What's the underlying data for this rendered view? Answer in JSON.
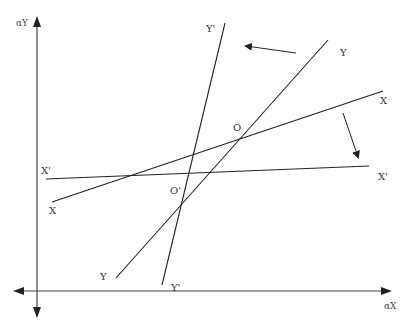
{
  "diagram": {
    "type": "economics-curve-shift",
    "colors": {
      "line": "#222222",
      "axis": "#333333",
      "text": "#333333",
      "background": "#ffffff"
    },
    "axes": {
      "y_label": "αY",
      "x_label": "αX"
    },
    "lines": [
      {
        "id": "YY",
        "label_top": "Y",
        "label_bottom": "Y",
        "x1": 116,
        "y1": 278,
        "x2": 328,
        "y2": 40
      },
      {
        "id": "Y'Y'",
        "label_top": "Y'",
        "label_bottom": "Y'",
        "x1": 162,
        "y1": 285,
        "x2": 225,
        "y2": 23
      },
      {
        "id": "XX",
        "label_left": "X",
        "label_right": "X",
        "x1": 52,
        "y1": 202,
        "x2": 383,
        "y2": 91
      },
      {
        "id": "X'X'",
        "label_left": "X'",
        "label_right": "X'",
        "x1": 46,
        "y1": 179,
        "x2": 369,
        "y2": 166
      }
    ],
    "points": [
      {
        "label": "O",
        "description": "intersection of XX and YY"
      },
      {
        "label": "O'",
        "description": "intersection of X'X' and Y'Y'"
      }
    ],
    "shift_arrows": [
      {
        "from": "YY",
        "to": "Y'Y'",
        "direction": "left"
      },
      {
        "from": "XX",
        "to": "X'X'",
        "direction": "down"
      }
    ]
  }
}
